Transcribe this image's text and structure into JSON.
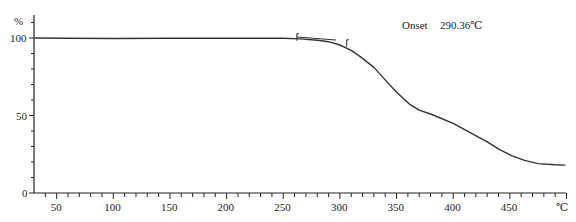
{
  "chart_data": {
    "type": "line",
    "title": "",
    "xlabel": "℃",
    "ylabel": "%",
    "xlim": [
      30,
      500
    ],
    "ylim": [
      0,
      110
    ],
    "grid": false,
    "legend": null,
    "x_ticks": [
      50,
      100,
      150,
      200,
      250,
      300,
      350,
      400,
      450
    ],
    "y_ticks": [
      0,
      50,
      100
    ],
    "series": [
      {
        "name": "TGA weight",
        "x": [
          30,
          60,
          100,
          150,
          200,
          250,
          265,
          280,
          290,
          300,
          310,
          318,
          330,
          340,
          350,
          362,
          370,
          380,
          400,
          415,
          430,
          441,
          452,
          463,
          475,
          490,
          499
        ],
        "y": [
          100,
          99.9,
          99.7,
          99.8,
          99.9,
          99.8,
          99.4,
          98.6,
          97.6,
          95.5,
          92.0,
          88.0,
          81.0,
          73.0,
          65.0,
          57.0,
          53.5,
          51.0,
          45.0,
          39.0,
          33.0,
          28.0,
          24.0,
          21.0,
          19.0,
          18.2,
          18.0
        ]
      }
    ],
    "annotations": [
      {
        "label": "Onset",
        "value": "290.36℃"
      }
    ],
    "onset_markers": [
      {
        "x": 262,
        "y": 100.2
      },
      {
        "x": 306,
        "y": 96.3
      }
    ]
  },
  "axis_labels": {
    "y_unit": "%",
    "x_unit": "℃",
    "y_ticks": [
      "100",
      "50",
      "0"
    ],
    "x_ticks": [
      "50",
      "100",
      "150",
      "200",
      "250",
      "300",
      "350",
      "400",
      "450"
    ]
  },
  "annotation": {
    "onset_label": "Onset",
    "onset_value": "290.36℃"
  }
}
